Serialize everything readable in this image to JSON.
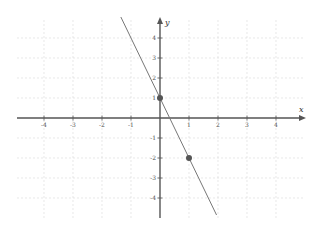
{
  "chart_data": {
    "type": "line",
    "title": "",
    "xlabel": "x",
    "ylabel": "y",
    "xlim": [
      -5,
      5
    ],
    "ylim": [
      -5,
      5
    ],
    "grid": true,
    "x_ticks": [
      -4,
      -3,
      -2,
      -1,
      1,
      2,
      3,
      4
    ],
    "y_ticks": [
      4,
      3,
      2,
      1,
      -1,
      -2,
      -3,
      -4
    ],
    "series": [
      {
        "name": "line",
        "equation": "y = -3x + 1",
        "slope": -3,
        "intercept": 1,
        "x_range": [
          -1.35,
          1.95
        ]
      }
    ],
    "points": [
      {
        "x": 0,
        "y": 1
      },
      {
        "x": 1,
        "y": -2
      }
    ]
  },
  "colors": {
    "axis": "#555555",
    "grid": "#d8d8d8",
    "line": "#777777",
    "point": "#555555"
  }
}
